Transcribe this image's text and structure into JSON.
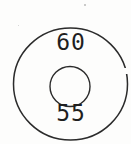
{
  "diagram": {
    "type": "concentric-circles",
    "top_label": "60",
    "bottom_label": "55",
    "stroke_color": "#2b2b2b",
    "background_color": "#fdfdfc",
    "outer_circle": {
      "cx": "70.5",
      "cy": "84",
      "rx": "57",
      "ry": "56"
    },
    "inner_circle": {
      "cx": "70",
      "cy": "86.5",
      "r": "20"
    }
  }
}
